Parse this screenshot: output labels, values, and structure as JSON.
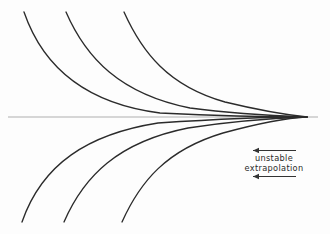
{
  "figure": {
    "background_color": "#fdfdfd",
    "curve_color": "#2b2b2b",
    "axis_color": "#c9c9c9",
    "annotation": {
      "line1": "unstable",
      "line2": "extrapolation",
      "arrow_direction": "left",
      "arrow_color": "#333333",
      "text_color": "#2b2b2b"
    }
  },
  "chart_data": {
    "type": "line",
    "title": "",
    "subtitle": "",
    "xlabel": "",
    "ylabel": "",
    "grid": false,
    "legend": "none",
    "xlim": [
      0,
      330
    ],
    "ylim": [
      234,
      0
    ],
    "annotations": [
      {
        "text": "unstable",
        "x": 274,
        "y": 158
      },
      {
        "text": "extrapolation",
        "x": 274,
        "y": 168
      },
      {
        "text": "arrow-left",
        "x": 253,
        "y": 151,
        "x2": 296
      },
      {
        "text": "arrow-left",
        "x": 253,
        "y": 177,
        "x2": 296
      }
    ],
    "axis_line": {
      "x1": 8,
      "y1": 117,
      "x2": 318,
      "y2": 117,
      "color": "#c9c9c9"
    },
    "convergence_point": {
      "x": 307,
      "y": 117
    },
    "series": [
      {
        "name": "upper-1",
        "path": "M 24 12 C 44 70, 90 104, 160 113 C 220 116, 275 117, 307 117"
      },
      {
        "name": "upper-2",
        "path": "M 66 12 C 86 58, 120 94, 190 108 C 235 114, 280 116, 307 117"
      },
      {
        "name": "upper-3",
        "path": "M 124 12 C 142 52, 168 86, 225 102 C 258 110, 288 115, 307 117"
      },
      {
        "name": "lower-1",
        "path": "M 22 222 C 42 164, 88 134, 158 123 C 218 119, 274 117, 307 117"
      },
      {
        "name": "lower-2",
        "path": "M 64 222 C 84 176, 118 142, 188 128 C 233 121, 280 118, 307 117"
      },
      {
        "name": "lower-3",
        "path": "M 122 222 C 140 182, 166 150, 223 133 C 256 124, 287 118, 307 117"
      }
    ]
  }
}
